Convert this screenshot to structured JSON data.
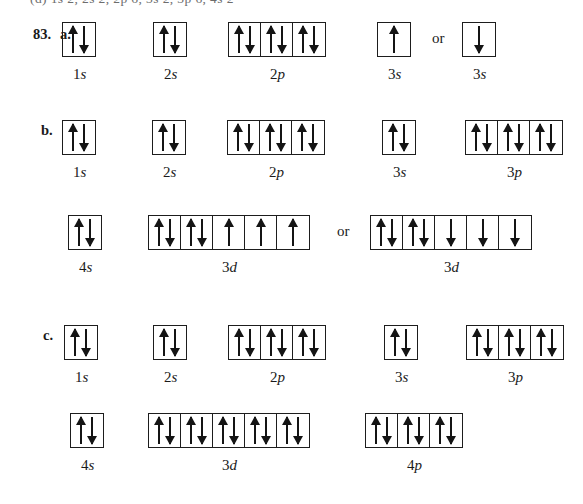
{
  "page": {
    "clipped_top_line": "(d) 1s 2, 2s 2, 2p 6, 3s 2, 3p 6, 4s 2",
    "question_number": "83.",
    "or_word": "or"
  },
  "parts": [
    {
      "letter": "a.",
      "rows": [
        {
          "groups": [
            {
              "label_main": "1",
              "label_sub": "s",
              "cells": [
                "updown"
              ]
            },
            {
              "label_main": "2",
              "label_sub": "s",
              "cells": [
                "updown"
              ]
            },
            {
              "label_main": "2",
              "label_sub": "p",
              "cells": [
                "updown",
                "updown",
                "updown"
              ]
            },
            {
              "label_main": "3",
              "label_sub": "s",
              "cells": [
                "up"
              ]
            },
            {
              "label_main": "3",
              "label_sub": "s",
              "cells": [
                "down"
              ],
              "preceded_by_or": true
            }
          ]
        }
      ]
    },
    {
      "letter": "b.",
      "rows": [
        {
          "groups": [
            {
              "label_main": "1",
              "label_sub": "s",
              "cells": [
                "updown"
              ]
            },
            {
              "label_main": "2",
              "label_sub": "s",
              "cells": [
                "updown"
              ]
            },
            {
              "label_main": "2",
              "label_sub": "p",
              "cells": [
                "updown",
                "updown",
                "updown"
              ]
            },
            {
              "label_main": "3",
              "label_sub": "s",
              "cells": [
                "updown"
              ]
            },
            {
              "label_main": "3",
              "label_sub": "p",
              "cells": [
                "updown",
                "updown",
                "updown"
              ]
            }
          ]
        },
        {
          "groups": [
            {
              "label_main": "4",
              "label_sub": "s",
              "cells": [
                "updown"
              ]
            },
            {
              "label_main": "3",
              "label_sub": "d",
              "cells": [
                "updown",
                "updown",
                "up",
                "up",
                "up"
              ]
            },
            {
              "label_main": "3",
              "label_sub": "d",
              "cells": [
                "updown",
                "updown",
                "down",
                "down",
                "down"
              ],
              "preceded_by_or": true
            }
          ]
        }
      ]
    },
    {
      "letter": "c.",
      "rows": [
        {
          "groups": [
            {
              "label_main": "1",
              "label_sub": "s",
              "cells": [
                "updown"
              ]
            },
            {
              "label_main": "2",
              "label_sub": "s",
              "cells": [
                "updown"
              ]
            },
            {
              "label_main": "2",
              "label_sub": "p",
              "cells": [
                "updown",
                "updown",
                "updown"
              ]
            },
            {
              "label_main": "3",
              "label_sub": "s",
              "cells": [
                "updown"
              ]
            },
            {
              "label_main": "3",
              "label_sub": "p",
              "cells": [
                "updown",
                "updown",
                "updown"
              ]
            }
          ]
        },
        {
          "groups": [
            {
              "label_main": "4",
              "label_sub": "s",
              "cells": [
                "updown"
              ]
            },
            {
              "label_main": "3",
              "label_sub": "d",
              "cells": [
                "updown",
                "updown",
                "updown",
                "updown",
                "updown"
              ]
            },
            {
              "label_main": "4",
              "label_sub": "p",
              "cells": [
                "updown",
                "updown",
                "updown"
              ]
            }
          ]
        }
      ]
    }
  ],
  "layout": {
    "question_number_pos": {
      "x": 33,
      "y": 26
    },
    "part_letter_pos": [
      {
        "x": 60,
        "y": 26
      },
      {
        "x": 41,
        "y": 122
      },
      {
        "x": 43,
        "y": 327
      }
    ],
    "rows": [
      {
        "box_top": 22,
        "label_top": 66,
        "groups": [
          {
            "x": 62
          },
          {
            "x": 153
          },
          {
            "x": 228
          },
          {
            "x": 377
          },
          {
            "x": 462,
            "or_x": 432
          }
        ]
      },
      {
        "box_top": 120,
        "label_top": 164,
        "groups": [
          {
            "x": 62
          },
          {
            "x": 152
          },
          {
            "x": 227
          },
          {
            "x": 382
          },
          {
            "x": 465
          }
        ]
      },
      {
        "box_top": 215,
        "label_top": 259,
        "groups": [
          {
            "x": 68
          },
          {
            "x": 148
          },
          {
            "x": 370,
            "or_x": 337
          }
        ]
      },
      {
        "box_top": 325,
        "label_top": 369,
        "groups": [
          {
            "x": 64
          },
          {
            "x": 153
          },
          {
            "x": 228
          },
          {
            "x": 384
          },
          {
            "x": 466
          }
        ]
      },
      {
        "box_top": 413,
        "label_top": 457,
        "groups": [
          {
            "x": 70
          },
          {
            "x": 148
          },
          {
            "x": 365
          }
        ]
      }
    ]
  }
}
